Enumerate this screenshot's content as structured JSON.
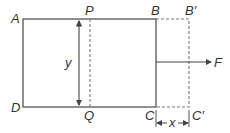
{
  "diagram": {
    "labels": {
      "A": "A",
      "B": "B",
      "B_prime": "B′",
      "C": "C",
      "C_prime": "C′",
      "D": "D",
      "P": "P",
      "Q": "Q",
      "F": "F",
      "x": "x",
      "y": "y"
    },
    "colors": {
      "line": "#555555",
      "dashed": "#777777",
      "text": "#333333"
    }
  }
}
